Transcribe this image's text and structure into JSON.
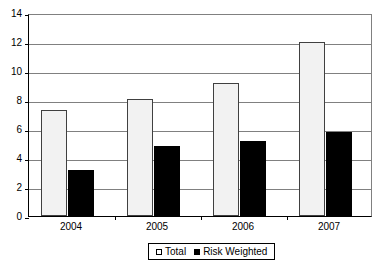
{
  "chart_data": {
    "type": "bar",
    "title": "",
    "subtitle": "",
    "xlabel": "",
    "ylabel": "",
    "categories": [
      "2004",
      "2005",
      "2006",
      "2007"
    ],
    "series": [
      {
        "name": "Total",
        "values": [
          7.3,
          8.1,
          9.2,
          12.0
        ],
        "color": "#f2f2f2"
      },
      {
        "name": "Risk Weighted",
        "values": [
          3.2,
          4.8,
          5.2,
          5.8
        ],
        "color": "#000000"
      }
    ],
    "ylim": [
      0,
      14
    ],
    "ytick_step": 2,
    "yticks": [
      "0",
      "2",
      "4",
      "6",
      "8",
      "10",
      "12",
      "14"
    ],
    "grid": "horizontal",
    "legend_position": "bottom-center",
    "legend_entries": [
      "Total",
      "Risk Weighted"
    ]
  },
  "legend": {
    "items": [
      {
        "label": "Total",
        "swatch": "legend-swatch-total"
      },
      {
        "label": "Risk Weighted",
        "swatch": "legend-swatch-risk"
      }
    ]
  },
  "colors": {
    "total_bar_fill": "#f2f2f2",
    "total_bar_border": "#404040",
    "risk_bar_fill": "#000000",
    "gridline": "#808080",
    "axis": "#000000",
    "background": "#ffffff"
  }
}
